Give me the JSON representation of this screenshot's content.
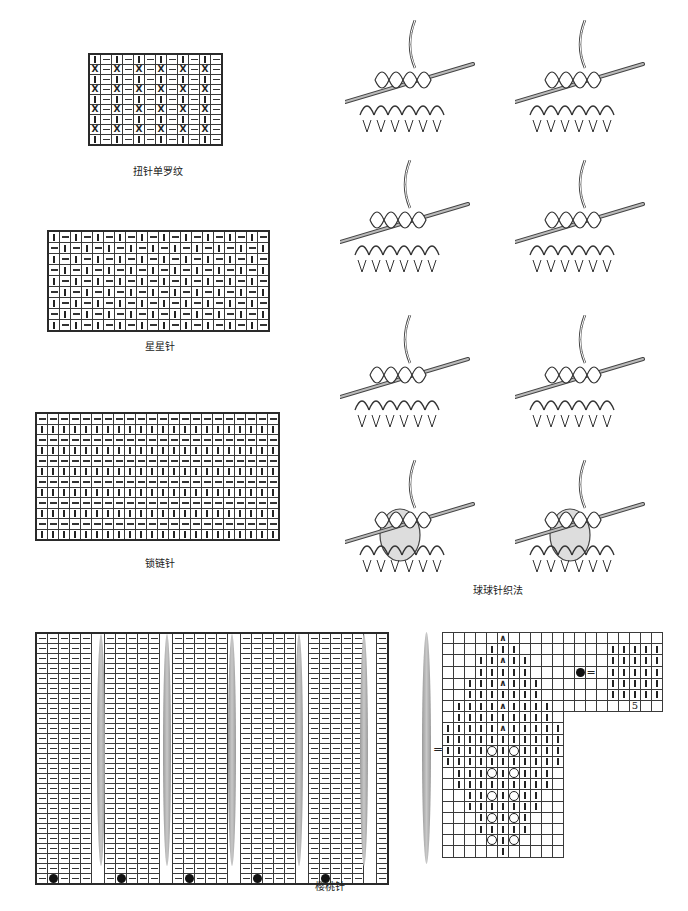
{
  "charts": {
    "twisted_rib": {
      "caption": "扭针单罗纹",
      "cols": 12,
      "rows": 9,
      "pattern_rows": [
        "k|p",
        "x|p"
      ],
      "note": "Alternating rows: knit/purl and twisted-knit/purl"
    },
    "star_stitch": {
      "caption": "星星针",
      "cols": 20,
      "rows": 9
    },
    "chain_stitch": {
      "caption": "锁链针",
      "cols": 22,
      "rows": 12
    },
    "bobble_method": {
      "caption": "球球针织法",
      "steps": 8
    },
    "cherry_stitch": {
      "caption": "樱桃针",
      "groups": 6,
      "group_width": 5,
      "rows": 25,
      "equals": "="
    },
    "cherry_detail": {
      "cols": 11,
      "rows": 20,
      "inset_label": "5",
      "equals": "="
    }
  },
  "symbols": {
    "knit": "|",
    "purl": "−",
    "twisted_knit": "X",
    "bobble": "●",
    "yarn_over": "○",
    "decrease": "∧"
  },
  "colors": {
    "grid_line": "#3a3a3a",
    "spindle": "#a8a8a8",
    "ink": "#222222",
    "background": "#ffffff"
  }
}
